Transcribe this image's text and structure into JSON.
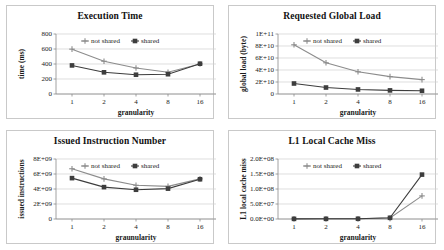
{
  "figure": {
    "panel_count": 4,
    "series_names": [
      "not shared",
      "shared"
    ],
    "colors": {
      "not_shared": "#8c8c8c",
      "shared": "#3d3d3d",
      "grid": "#d0d0d0",
      "axis": "#8c8c8c",
      "frame": "#c9c9c9",
      "text": "#1a1a1a",
      "background": "#ffffff"
    }
  },
  "chart_data": [
    {
      "type": "line",
      "title": "Execution Time",
      "xlabel": "granularity",
      "ylabel": "time (ms)",
      "categories": [
        "1",
        "2",
        "4",
        "8",
        "16"
      ],
      "yticks": [
        "0",
        "200",
        "400",
        "600",
        "800"
      ],
      "ytick_values": [
        0,
        200,
        400,
        600,
        800
      ],
      "ylim": [
        0,
        800
      ],
      "grid": true,
      "legend": [
        "not shared",
        "shared"
      ],
      "legend_position": "inside-top-center",
      "series": [
        {
          "name": "not shared",
          "marker": "plus",
          "values": [
            598,
            437,
            347,
            291,
            401
          ]
        },
        {
          "name": "shared",
          "marker": "square",
          "values": [
            381,
            289,
            257,
            264,
            404
          ]
        }
      ]
    },
    {
      "type": "line",
      "title": "Requested Global Load",
      "xlabel": "granularity",
      "ylabel": "global load (byte)",
      "categories": [
        "1",
        "2",
        "4",
        "8",
        "16"
      ],
      "yticks": [
        "0",
        "2E+10",
        "4E+10",
        "6E+10",
        "8E+10",
        "1E+11"
      ],
      "ytick_values": [
        0,
        20000000000,
        40000000000,
        60000000000,
        80000000000,
        100000000000
      ],
      "ylim": [
        0,
        100000000000
      ],
      "grid": true,
      "legend": [
        "not shared",
        "shared"
      ],
      "legend_position": "inside-top-center",
      "series": [
        {
          "name": "not shared",
          "marker": "plus",
          "values": [
            82000000000,
            52000000000,
            37000000000,
            29000000000,
            24000000000
          ]
        },
        {
          "name": "shared",
          "marker": "square",
          "values": [
            17500000000,
            10800000000,
            7600000000,
            6000000000,
            5400000000
          ]
        }
      ]
    },
    {
      "type": "line",
      "title": "Issued Instruction Number",
      "xlabel": "graunularity",
      "ylabel": "issued instructions",
      "categories": [
        "1",
        "2",
        "4",
        "8",
        "16"
      ],
      "yticks": [
        "0",
        "2E+09",
        "4E+09",
        "6E+09",
        "8E+09"
      ],
      "ytick_values": [
        0,
        2000000000,
        4000000000,
        6000000000,
        8000000000
      ],
      "ylim": [
        0,
        8000000000
      ],
      "grid": true,
      "legend": [
        "not shared",
        "shared"
      ],
      "legend_position": "inside-top-center",
      "series": [
        {
          "name": "not shared",
          "marker": "plus",
          "values": [
            6700000000,
            5350000000,
            4500000000,
            4350000000,
            5350000000
          ]
        },
        {
          "name": "shared",
          "marker": "square",
          "values": [
            5450000000,
            4250000000,
            3900000000,
            4050000000,
            5300000000
          ]
        }
      ]
    },
    {
      "type": "line",
      "title": "L1 Local Cache Miss",
      "xlabel": "granularity",
      "ylabel": "L1 local cache miss",
      "categories": [
        "1",
        "2",
        "4",
        "8",
        "16"
      ],
      "yticks": [
        "0.0E+00",
        "5.0E+07",
        "1.0E+08",
        "1.5E+08",
        "2.0E+08"
      ],
      "ytick_values": [
        0,
        50000000,
        100000000,
        150000000,
        200000000
      ],
      "ylim": [
        0,
        200000000
      ],
      "grid": true,
      "legend": [
        "not shared",
        "shared"
      ],
      "legend_position": "inside-top-center",
      "series": [
        {
          "name": "not shared",
          "marker": "plus",
          "values": [
            600000,
            700000,
            900000,
            3500000,
            77000000
          ]
        },
        {
          "name": "shared",
          "marker": "square",
          "values": [
            500000,
            600000,
            800000,
            4000000,
            148000000
          ]
        }
      ]
    }
  ]
}
